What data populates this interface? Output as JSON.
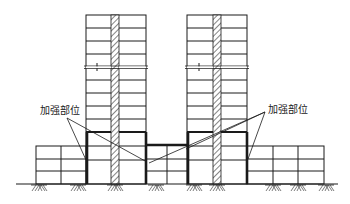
{
  "diagram": {
    "type": "structural-elevation",
    "labels": {
      "left": "加强部位",
      "right": "加强部位"
    },
    "colors": {
      "line": "#1a1a1a",
      "hatch": "#333333",
      "background": "#ffffff"
    },
    "towers": [
      {
        "name": "left-tower",
        "x": 86,
        "width": 60,
        "top": 15,
        "shear_wall_x": 111,
        "shear_wall_width": 8
      },
      {
        "name": "right-tower",
        "x": 187,
        "width": 60,
        "top": 15,
        "shear_wall_x": 213,
        "shear_wall_width": 8
      }
    ],
    "podium_levels": 3,
    "ground_y": 184,
    "break_line_y": 67
  }
}
